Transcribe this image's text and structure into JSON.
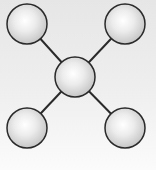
{
  "diagram": {
    "type": "star-network",
    "colors": {
      "background_top": "#e6e6e6",
      "background_bottom": "#fbfbfb",
      "node_highlight": "#ffffff",
      "node_shade": "#c4c4c4",
      "node_stroke": "#2a2a2a",
      "edge": "#2a2a2a"
    },
    "nodes": [
      {
        "id": "center",
        "cx": 75,
        "cy": 77,
        "r": 20
      },
      {
        "id": "top-left",
        "cx": 27,
        "cy": 24,
        "r": 20
      },
      {
        "id": "top-right",
        "cx": 125,
        "cy": 24,
        "r": 20
      },
      {
        "id": "bottom-left",
        "cx": 27,
        "cy": 128,
        "r": 20
      },
      {
        "id": "bottom-right",
        "cx": 125,
        "cy": 128,
        "r": 20
      }
    ],
    "edges": [
      {
        "from": "center",
        "to": "top-left"
      },
      {
        "from": "center",
        "to": "top-right"
      },
      {
        "from": "center",
        "to": "bottom-left"
      },
      {
        "from": "center",
        "to": "bottom-right"
      }
    ]
  }
}
